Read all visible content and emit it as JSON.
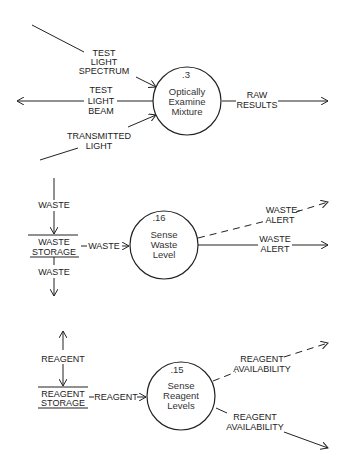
{
  "processes": [
    {
      "id": ".3",
      "lines": [
        "Optically",
        "Examine",
        "Mixture"
      ]
    },
    {
      "id": ".16",
      "lines": [
        "Sense",
        "Waste",
        "Level"
      ]
    },
    {
      "id": ".15",
      "lines": [
        "Sense",
        "Reagent",
        "Levels"
      ]
    }
  ],
  "stores": [
    {
      "lines": [
        "WASTE",
        "STORAGE"
      ]
    },
    {
      "lines": [
        "REAGENT",
        "STORAGE"
      ]
    }
  ],
  "flows": {
    "test_light_spectrum": [
      "TEST",
      "LIGHT",
      "SPECTRUM"
    ],
    "test_light_beam": [
      "TEST",
      "LIGHT",
      "BEAM"
    ],
    "transmitted_light": [
      "TRANSMITTED",
      "LIGHT"
    ],
    "raw_results": [
      "RAW",
      "RESULTS"
    ],
    "waste_in": "WASTE",
    "waste_to_process": "WASTE",
    "waste_out": "WASTE",
    "waste_alert_dashed": [
      "WASTE-",
      "ALERT"
    ],
    "waste_alert": [
      "WASTE",
      "ALERT"
    ],
    "reagent_store": "REAGENT",
    "reagent_to_process": "REAGENT",
    "reagent_availability_dashed": [
      "REAGENT",
      "AVAILABILITY"
    ],
    "reagent_availability": [
      "REAGENT",
      "AVAILABILITY"
    ]
  }
}
